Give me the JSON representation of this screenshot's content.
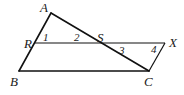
{
  "diagram": {
    "type": "geometry",
    "points": {
      "A": {
        "label": "A",
        "x": 51,
        "y": 13
      },
      "R": {
        "label": "R",
        "x": 35,
        "y": 43
      },
      "B": {
        "label": "B",
        "x": 19,
        "y": 71
      },
      "S": {
        "label": "S",
        "x": 100,
        "y": 43
      },
      "X": {
        "label": "X",
        "x": 165,
        "y": 43
      },
      "C": {
        "label": "C",
        "x": 149,
        "y": 71
      }
    },
    "segments": [
      "AB",
      "AC",
      "BC",
      "RX",
      "XC"
    ],
    "angles": [
      {
        "label": "1",
        "at": "R"
      },
      {
        "label": "2",
        "at": "S"
      },
      {
        "label": "3",
        "at": "S"
      },
      {
        "label": "4",
        "at": "X"
      }
    ]
  }
}
